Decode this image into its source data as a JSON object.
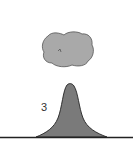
{
  "diagram": {
    "label": "3",
    "colors": {
      "background": "#ffffff",
      "cloud_fill": "#a9a9a9",
      "cloud_stroke": "#555555",
      "mountain_fill": "#7a7a7a",
      "mountain_stroke": "#222222",
      "ground": "#222222"
    },
    "elements": [
      "cloud",
      "mountain",
      "ground-line",
      "label"
    ]
  }
}
